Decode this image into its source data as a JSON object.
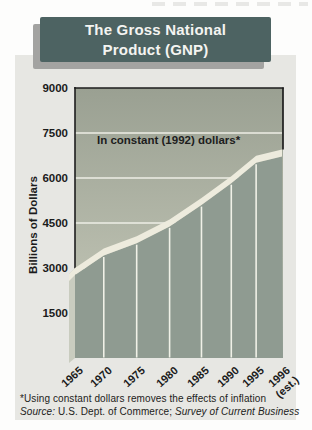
{
  "title": {
    "line1": "The Gross National",
    "line2": "Product (GNP)"
  },
  "footnotes": {
    "asterisk": "*Using constant dollars removes the effects of inflation",
    "source_label": "Source:",
    "source_body": " U.S. Dept. of Commerce; ",
    "source_publication": "Survey of Current Business"
  },
  "colors": {
    "panel_bg": "#e7e7e3",
    "title_box": "#4d6362",
    "title_text": "#f4f4f1",
    "title_shadow": "#a3a3a1",
    "plot_bg_top": "#9aa092",
    "plot_bg_bottom": "#c9ccbc",
    "area_fill": "#8f9b91",
    "area_top_band": "#edebdd",
    "area_left_bevel": "#c9ccbf",
    "gridline": "#eeeee6",
    "divider": "#f0f1e7",
    "axis": "#1d1d1d"
  },
  "chart_data": {
    "type": "area",
    "title": "The Gross National Product (GNP)",
    "annotation": "In constant (1992) dollars*",
    "ylabel": "Billions of Dollars",
    "xlabel": "",
    "categories": [
      "1965",
      "1970",
      "1975",
      "1980",
      "1985",
      "1990",
      "1995",
      "1996 (est.)"
    ],
    "values": [
      3000,
      3650,
      4060,
      4620,
      5330,
      6060,
      6740,
      6950
    ],
    "y_ticks": [
      1500,
      3000,
      4500,
      6000,
      7500,
      9000
    ],
    "ylim": [
      0,
      9000
    ],
    "grid": true,
    "legend": "none",
    "x_frac": [
      0,
      0.139,
      0.298,
      0.457,
      0.611,
      0.755,
      0.875,
      1.0
    ],
    "x_tick_lines": [
      [
        "1965"
      ],
      [
        "1970"
      ],
      [
        "1975"
      ],
      [
        "1980"
      ],
      [
        "1985"
      ],
      [
        "1990"
      ],
      [
        "1995"
      ],
      [
        "1996",
        "(est.)"
      ]
    ]
  }
}
